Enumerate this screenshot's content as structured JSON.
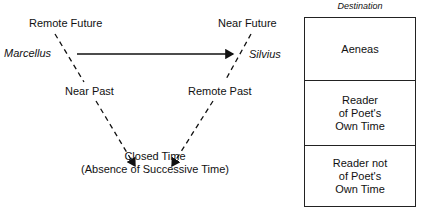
{
  "diagram": {
    "top_left_label": "Remote Future",
    "top_right_label": "Near Future",
    "left_name": "Marcellus",
    "right_name": "Silvius",
    "left_mid_label": "Near Past",
    "right_mid_label": "Remote Past",
    "bottom_label_line1": "Closed Time",
    "bottom_label_line2": "(Absence of Successive Time)"
  },
  "destination": {
    "header": "Destination",
    "cells": [
      {
        "lines": [
          "Aeneas"
        ]
      },
      {
        "lines": [
          "Reader",
          "of Poet's",
          "Own Time"
        ]
      },
      {
        "lines": [
          "Reader not",
          "of Poet's",
          "Own Time"
        ]
      }
    ]
  },
  "colors": {
    "ink": "#111111",
    "background": "#ffffff"
  }
}
